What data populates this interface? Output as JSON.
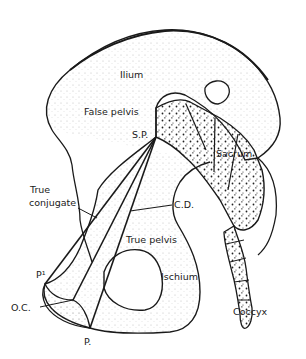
{
  "figure": {
    "labels": {
      "ilium": "Ilium",
      "false_pelvis": "False pelvis",
      "sp": "S.P.",
      "sacrum": "Sacrum",
      "true_conjugate_1": "True",
      "true_conjugate_2": "conjugate",
      "cd": "C.D.",
      "true_pelvis": "True pelvis",
      "p1": "P¹",
      "ischium": "Ischium",
      "oc": "O.C.",
      "coccyx": "Coccyx",
      "p": "P."
    },
    "lines": {
      "origin": "S.P.",
      "endpoints": [
        "P¹",
        "O.C.",
        "P."
      ]
    },
    "colors": {
      "ink": "#1a1a1a",
      "background": "#ffffff",
      "stipple": "#555555"
    }
  }
}
